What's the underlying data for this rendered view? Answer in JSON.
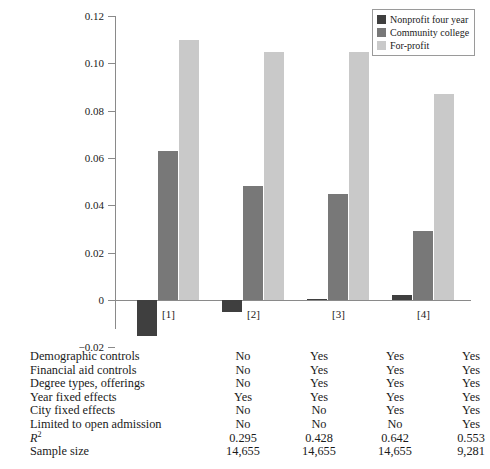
{
  "chart_data": {
    "type": "bar",
    "title": "",
    "subtitle": "",
    "xlabel": "",
    "ylabel": "",
    "grid": false,
    "legend_position": "top-right",
    "categories": [
      "[1]",
      "[2]",
      "[3]",
      "[4]"
    ],
    "ylim": [
      -0.02,
      0.12
    ],
    "yticks": [
      {
        "value": 0.12,
        "label": "0.12"
      },
      {
        "value": 0.1,
        "label": "0.10"
      },
      {
        "value": 0.08,
        "label": "0.08"
      },
      {
        "value": 0.06,
        "label": "0.06"
      },
      {
        "value": 0.04,
        "label": "0.04"
      },
      {
        "value": 0.02,
        "label": "0.02"
      },
      {
        "value": 0.0,
        "label": "0"
      },
      {
        "value": -0.02,
        "label": "−0.02"
      }
    ],
    "series": [
      {
        "name": "Nonprofit four year",
        "color": "#3f3f3f",
        "values": [
          -0.015,
          -0.005,
          0.0005,
          0.002
        ]
      },
      {
        "name": "Community college",
        "color": "#787878",
        "values": [
          0.063,
          0.048,
          0.045,
          0.029
        ]
      },
      {
        "name": "For-profit",
        "color": "#c9c9c9",
        "values": [
          0.11,
          0.105,
          0.105,
          0.087
        ]
      }
    ]
  },
  "legend": {
    "items": [
      {
        "label": "Nonprofit four year",
        "color": "#3f3f3f"
      },
      {
        "label": "Community college",
        "color": "#787878"
      },
      {
        "label": "For-profit",
        "color": "#c9c9c9"
      }
    ]
  },
  "spec_table": {
    "rows": [
      {
        "label": "Demographic controls",
        "italic": false,
        "superscript": "",
        "values": [
          "No",
          "Yes",
          "Yes",
          "Yes"
        ]
      },
      {
        "label": "Financial aid controls",
        "italic": false,
        "superscript": "",
        "values": [
          "No",
          "Yes",
          "Yes",
          "Yes"
        ]
      },
      {
        "label": "Degree types, offerings",
        "italic": false,
        "superscript": "",
        "values": [
          "No",
          "Yes",
          "Yes",
          "Yes"
        ]
      },
      {
        "label": "Year fixed effects",
        "italic": false,
        "superscript": "",
        "values": [
          "Yes",
          "Yes",
          "Yes",
          "Yes"
        ]
      },
      {
        "label": "City fixed effects",
        "italic": false,
        "superscript": "",
        "values": [
          "No",
          "No",
          "Yes",
          "Yes"
        ]
      },
      {
        "label": "Limited to open admission",
        "italic": false,
        "superscript": "",
        "values": [
          "No",
          "No",
          "No",
          "Yes"
        ]
      },
      {
        "label": "R",
        "italic": true,
        "superscript": "2",
        "values": [
          "0.295",
          "0.428",
          "0.642",
          "0.553"
        ]
      },
      {
        "label": "Sample size",
        "italic": false,
        "superscript": "",
        "values": [
          "14,655",
          "14,655",
          "14,655",
          "9,281"
        ]
      }
    ]
  },
  "caption": {
    "text": ""
  }
}
